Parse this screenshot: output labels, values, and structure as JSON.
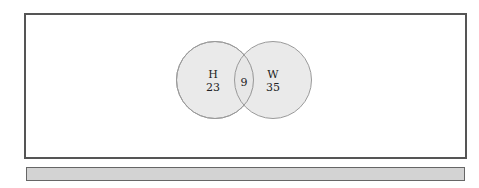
{
  "diagram": {
    "type": "venn",
    "sets": [
      {
        "name": "H",
        "only_count": "23"
      },
      {
        "name": "W",
        "only_count": "35"
      }
    ],
    "intersection_count": "9",
    "colors": {
      "circle_fill": "#e6e6e6",
      "circle_stroke": "#9a9a9a",
      "frame_border": "#555555",
      "bar_fill": "#d3d3d3"
    }
  }
}
